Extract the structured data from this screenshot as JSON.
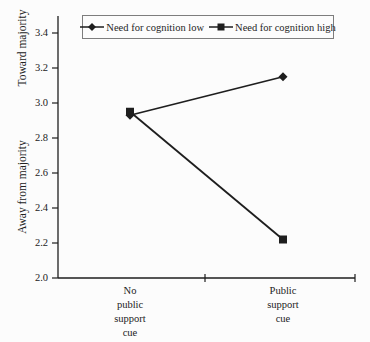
{
  "figure": {
    "background": "#fcfcfc",
    "ink": "#1e1e1e",
    "legend_border": "#7d7d7d"
  },
  "chart_data": {
    "type": "line",
    "title": "",
    "xlabel": "",
    "ylabel_top": "Toward majority",
    "ylabel_bottom": "Away from majority",
    "categories": [
      "No\npublic\nsupport\ncue",
      "Public\nsupport\ncue"
    ],
    "series": [
      {
        "name": "Need for cognition low",
        "marker": "diamond",
        "values": [
          2.93,
          3.15
        ]
      },
      {
        "name": "Need for cognition high",
        "marker": "square",
        "values": [
          2.95,
          2.22
        ]
      }
    ],
    "ylim": [
      2.0,
      3.4
    ],
    "yticks": [
      2.0,
      2.2,
      2.4,
      2.6,
      2.8,
      3.0,
      3.2,
      3.4
    ],
    "ytick_labels": [
      "2.0",
      "2.2",
      "2.4",
      "2.6",
      "2.8",
      "3.0",
      "3.2",
      "3.4"
    ],
    "grid": false,
    "legend_position": "top"
  }
}
